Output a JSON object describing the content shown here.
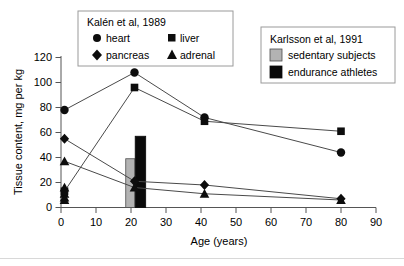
{
  "chart_data": {
    "type": "line",
    "title": "",
    "xlabel": "Age (years)",
    "ylabel": "Tissue content, mg per kg",
    "xlim": [
      0,
      90
    ],
    "ylim": [
      0,
      120
    ],
    "xticks": [
      0,
      10,
      20,
      30,
      40,
      50,
      60,
      70,
      80,
      90
    ],
    "yticks": [
      0,
      20,
      40,
      60,
      80,
      100,
      120
    ],
    "grid": false,
    "series": [
      {
        "name": "heart",
        "marker": "circle",
        "source": "Kalén et al, 1989",
        "x": [
          1,
          21,
          41,
          80
        ],
        "values": [
          78,
          108,
          72,
          44
        ]
      },
      {
        "name": "liver",
        "marker": "square",
        "source": "Kalén et al, 1989",
        "x": [
          1,
          21,
          41,
          80
        ],
        "values": [
          13,
          96,
          69,
          61
        ]
      },
      {
        "name": "pancreas",
        "marker": "diamond",
        "source": "Kalén et al, 1989",
        "x": [
          1,
          21,
          41,
          80
        ],
        "values": [
          55,
          21,
          18,
          7
        ]
      },
      {
        "name": "adrenal",
        "marker": "triangle",
        "source": "Kalén et al, 1989",
        "x": [
          1,
          21,
          41,
          80
        ],
        "values": [
          37,
          16,
          11,
          6
        ]
      }
    ],
    "extra_points": [
      {
        "series": "low-cluster",
        "x": 1,
        "values": [
          16,
          11,
          8,
          6
        ]
      }
    ],
    "bars": [
      {
        "name": "sedentary subjects",
        "x": 18.5,
        "width": 2.6,
        "value": 39,
        "color": "#b3b3b3"
      },
      {
        "name": "endurance athletes",
        "x": 21.2,
        "width": 3.0,
        "value": 57,
        "color": "#0a0a0a"
      }
    ]
  },
  "legend_kalen": {
    "title": "Kalén et al, 1989",
    "items": [
      {
        "label": "heart",
        "marker": "circle-marker"
      },
      {
        "label": "liver",
        "marker": "square-marker"
      },
      {
        "label": "pancreas",
        "marker": "diamond-marker"
      },
      {
        "label": "adrenal",
        "marker": "triangle-marker"
      }
    ]
  },
  "legend_karlsson": {
    "title": "Karlsson et al, 1991",
    "items": [
      {
        "label": "sedentary subjects",
        "swatch": "gray-swatch",
        "color": "#b3b3b3"
      },
      {
        "label": "endurance athletes",
        "swatch": "black-swatch",
        "color": "#0a0a0a"
      }
    ]
  },
  "axes": {
    "y_title": "Tissue content, mg per kg",
    "x_title": "Age (years)",
    "y_tick_labels": [
      "0",
      "20",
      "40",
      "60",
      "80",
      "100",
      "120"
    ],
    "x_tick_labels": [
      "0",
      "10",
      "20",
      "30",
      "40",
      "50",
      "60",
      "70",
      "80",
      "90"
    ]
  }
}
